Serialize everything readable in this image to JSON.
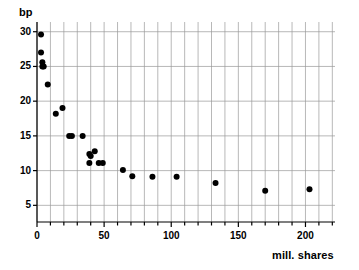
{
  "chart_data": {
    "type": "scatter",
    "title": "",
    "xlabel": "mill. shares",
    "ylabel": "bp",
    "xlim": [
      0,
      222
    ],
    "ylim": [
      2.6,
      31.4
    ],
    "grid": true,
    "legend": null,
    "x_major_ticks": [
      0,
      50,
      100,
      150,
      200
    ],
    "x_major_tick_labels": [
      "0",
      "50",
      "100",
      "150",
      "200"
    ],
    "x_minor_tick_step": 10,
    "x_gridline_step": 10,
    "y_major_ticks": [
      5,
      10,
      15,
      20,
      25,
      30
    ],
    "y_major_tick_labels": [
      "5",
      "10",
      "15",
      "20",
      "25",
      "30"
    ],
    "y_gridline_step": 5,
    "marker": "filled-circle",
    "marker_color": "#000000",
    "marker_size_px": 6,
    "grid_color": "#999999",
    "frame_color": "#000000",
    "points": [
      {
        "x": 3,
        "y": 29.6
      },
      {
        "x": 3,
        "y": 27.0
      },
      {
        "x": 4,
        "y": 25.6
      },
      {
        "x": 4,
        "y": 25.0
      },
      {
        "x": 5,
        "y": 25.0
      },
      {
        "x": 8,
        "y": 22.4
      },
      {
        "x": 14,
        "y": 18.2
      },
      {
        "x": 19,
        "y": 19.0
      },
      {
        "x": 24,
        "y": 15.0
      },
      {
        "x": 26,
        "y": 15.0
      },
      {
        "x": 34,
        "y": 15.0
      },
      {
        "x": 39,
        "y": 12.4
      },
      {
        "x": 40,
        "y": 12.1
      },
      {
        "x": 43,
        "y": 12.8
      },
      {
        "x": 39,
        "y": 11.1
      },
      {
        "x": 46,
        "y": 11.1
      },
      {
        "x": 49,
        "y": 11.1
      },
      {
        "x": 64,
        "y": 10.1
      },
      {
        "x": 71,
        "y": 9.2
      },
      {
        "x": 86,
        "y": 9.1
      },
      {
        "x": 104,
        "y": 9.1
      },
      {
        "x": 133,
        "y": 8.2
      },
      {
        "x": 170,
        "y": 7.1
      },
      {
        "x": 203,
        "y": 7.3
      }
    ]
  }
}
